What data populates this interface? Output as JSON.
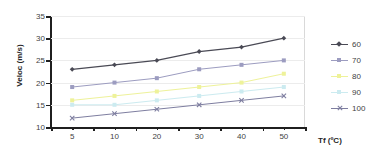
{
  "chart_data": {
    "type": "line",
    "title": "",
    "xlabel": "Tf (ºC)",
    "ylabel": "Veloc (m/s)",
    "categories": [
      "5",
      "10",
      "20",
      "30",
      "40",
      "50"
    ],
    "x_tick_labels": [
      "5",
      "10",
      "20",
      "30",
      "40",
      "50"
    ],
    "y_tick_labels": [
      "10",
      "15",
      "20",
      "25",
      "30",
      "35"
    ],
    "ylim": [
      10,
      35
    ],
    "y_ticks": [
      10,
      15,
      20,
      25,
      30,
      35
    ],
    "grid": true,
    "grid_axis": "y",
    "legend_position": "right",
    "series": [
      {
        "name": "60",
        "values": [
          23,
          24,
          25,
          27,
          28,
          30
        ],
        "color": "#4a4a55",
        "marker": "diamond"
      },
      {
        "name": "70",
        "values": [
          19,
          20,
          21,
          23,
          24,
          25
        ],
        "color": "#9c9cc0",
        "marker": "square"
      },
      {
        "name": "80",
        "values": [
          16,
          17,
          18,
          19,
          20,
          22
        ],
        "color": "#eef29a",
        "marker": "square"
      },
      {
        "name": "90",
        "values": [
          15,
          15,
          16,
          17,
          18,
          19
        ],
        "color": "#ccebf0",
        "marker": "square"
      },
      {
        "name": "100",
        "values": [
          12,
          13,
          14,
          15,
          16,
          17
        ],
        "color": "#7e7ea0",
        "marker": "cross"
      }
    ]
  },
  "legend": {
    "entries": [
      {
        "label": "60"
      },
      {
        "label": "70"
      },
      {
        "label": "80"
      },
      {
        "label": "90"
      },
      {
        "label": "100"
      }
    ]
  },
  "colors": {
    "axis": "#1f1f1f",
    "gridline": "#ececec",
    "plot_border": "#d9d9d9",
    "text": "#3f3f3f",
    "background": "#ffffff"
  }
}
